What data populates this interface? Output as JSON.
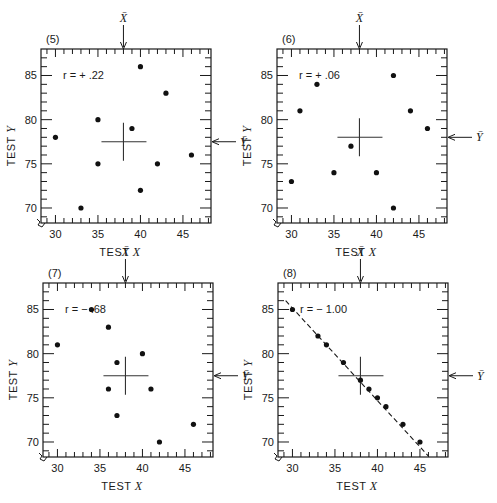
{
  "chart_data": [
    {
      "type": "scatter",
      "panel_label": "(5)",
      "annotation": "r = + .22",
      "r": 0.22,
      "xlabel": "TEST X",
      "ylabel": "TEST Y",
      "xlim": [
        28.3,
        48.3
      ],
      "ylim": [
        68.3,
        88
      ],
      "xticks": [
        30,
        35,
        40,
        45
      ],
      "yticks": [
        70,
        75,
        80,
        85
      ],
      "mean_x": 38,
      "mean_y": 77.5,
      "mean_x_label": "X̄",
      "mean_y_label": "Ȳ",
      "points": [
        [
          30,
          78
        ],
        [
          33,
          70
        ],
        [
          35,
          80
        ],
        [
          35,
          75
        ],
        [
          39,
          79
        ],
        [
          40,
          86
        ],
        [
          40,
          72
        ],
        [
          42,
          75
        ],
        [
          43,
          83
        ],
        [
          46,
          76
        ]
      ],
      "fit_line": null
    },
    {
      "type": "scatter",
      "panel_label": "(6)",
      "annotation": "r = + .06",
      "r": 0.06,
      "xlabel": "TEST X",
      "ylabel": "TEST Y",
      "xlim": [
        28.3,
        48.3
      ],
      "ylim": [
        68.3,
        88
      ],
      "xticks": [
        30,
        35,
        40,
        45
      ],
      "yticks": [
        70,
        75,
        80,
        85
      ],
      "mean_x": 38,
      "mean_y": 78,
      "mean_x_label": "X̄",
      "mean_y_label": "Ȳ",
      "points": [
        [
          30,
          73
        ],
        [
          31,
          81
        ],
        [
          33,
          84
        ],
        [
          35,
          74
        ],
        [
          37,
          77
        ],
        [
          40,
          74
        ],
        [
          42,
          85
        ],
        [
          42,
          70
        ],
        [
          44,
          81
        ],
        [
          46,
          79
        ]
      ],
      "fit_line": null
    },
    {
      "type": "scatter",
      "panel_label": "(7)",
      "annotation": "r = − .68",
      "r": -0.68,
      "xlabel": "TEST X",
      "ylabel": "TEST Y",
      "xlim": [
        28.3,
        48.3
      ],
      "ylim": [
        68.3,
        88
      ],
      "xticks": [
        30,
        35,
        40,
        45
      ],
      "yticks": [
        70,
        75,
        80,
        85
      ],
      "mean_x": 38,
      "mean_y": 77.5,
      "mean_x_label": "X̄",
      "mean_y_label": "Ȳ",
      "points": [
        [
          30,
          81
        ],
        [
          34,
          85
        ],
        [
          36,
          83
        ],
        [
          36,
          76
        ],
        [
          37,
          79
        ],
        [
          37,
          73
        ],
        [
          40,
          80
        ],
        [
          41,
          76
        ],
        [
          42,
          70
        ],
        [
          46,
          72
        ]
      ],
      "fit_line": null
    },
    {
      "type": "scatter",
      "panel_label": "(8)",
      "annotation": "r = − 1.00",
      "r": -1.0,
      "xlabel": "TEST X",
      "ylabel": "TEST Y",
      "xlim": [
        28.3,
        48.3
      ],
      "ylim": [
        68.3,
        88
      ],
      "xticks": [
        30,
        35,
        40,
        45
      ],
      "yticks": [
        70,
        75,
        80,
        85
      ],
      "mean_x": 38,
      "mean_y": 77.5,
      "mean_x_label": "X̄",
      "mean_y_label": "Ȳ",
      "points": [
        [
          30,
          85
        ],
        [
          33,
          82
        ],
        [
          34,
          81
        ],
        [
          36,
          79
        ],
        [
          38,
          77
        ],
        [
          39,
          76
        ],
        [
          40,
          75
        ],
        [
          41,
          74
        ],
        [
          43,
          72
        ],
        [
          45,
          70
        ]
      ],
      "fit_line": {
        "style": "dashed",
        "from": [
          29.2,
          86
        ],
        "to": [
          46,
          68.4
        ]
      }
    }
  ]
}
